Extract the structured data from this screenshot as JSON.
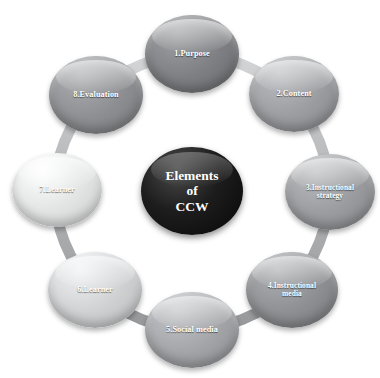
{
  "diagram": {
    "title": "Elements of CCW",
    "type": "circular-cycle",
    "background_color": "#ffffff",
    "connector_color": "#b9b9b9",
    "label_color": "#ffffff",
    "center": {
      "line1": "Elements",
      "line2": "of",
      "line3": "CCW",
      "color": "#121212"
    },
    "nodes": [
      {
        "index": "1",
        "label": "1.Purpose",
        "line1": "1.Purpose",
        "line2": "",
        "color": "#7e8083",
        "cx": 192,
        "cy": 54,
        "rx": 47,
        "ry": 39,
        "font_size": 8.2
      },
      {
        "index": "2",
        "label": "2.Content",
        "line1": "2.Content",
        "line2": "",
        "color": "#9b9da0",
        "cx": 294,
        "cy": 94,
        "rx": 45,
        "ry": 38,
        "font_size": 8.2
      },
      {
        "index": "3",
        "label": "3.Instructional strategy",
        "line1": "3.Instructional",
        "line2": "strategy",
        "color": "#9a9c9f",
        "cx": 330,
        "cy": 192,
        "rx": 45,
        "ry": 38,
        "font_size": 7.4
      },
      {
        "index": "4",
        "label": "4.Instructional media",
        "line1": "4.Instructional",
        "line2": "media",
        "color": "#8e9093",
        "cx": 292,
        "cy": 290,
        "rx": 46,
        "ry": 38,
        "font_size": 7.4
      },
      {
        "index": "5",
        "label": "5.Social media",
        "line1": "5.Social media",
        "line2": "",
        "color": "#a3a5a8",
        "cx": 192,
        "cy": 330,
        "rx": 47,
        "ry": 38,
        "font_size": 8.2
      },
      {
        "index": "6",
        "label": "6.Learner",
        "line1": "6.Learner",
        "line2": "",
        "color": "#cfd1d2",
        "cx": 95,
        "cy": 290,
        "rx": 47,
        "ry": 38,
        "font_size": 8.2
      },
      {
        "index": "7",
        "label": "7.Learner",
        "line1": "7.Learner",
        "line2": "",
        "color": "#e2e4e4",
        "cx": 57,
        "cy": 190,
        "rx": 45,
        "ry": 37,
        "font_size": 8.2
      },
      {
        "index": "8",
        "label": "8.Evaluation",
        "line1": "8.Evaluation",
        "line2": "",
        "color": "#8d8f92",
        "cx": 96,
        "cy": 95,
        "rx": 47,
        "ry": 39,
        "font_size": 8.2
      }
    ]
  }
}
